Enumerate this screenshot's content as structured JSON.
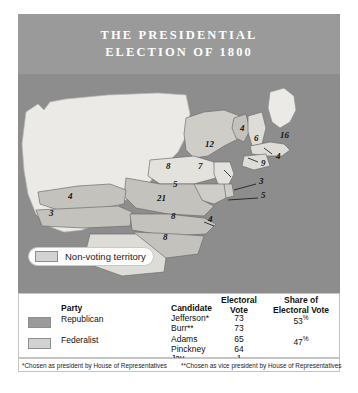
{
  "title": {
    "line1": "THE PRESIDENTIAL",
    "line2": "ELECTION OF 1800"
  },
  "legend": {
    "label": "Non-voting territory"
  },
  "map": {
    "state_votes": [
      {
        "state": "Vermont",
        "votes": "4",
        "x": 222,
        "y": 57
      },
      {
        "state": "New Hampshire",
        "votes": "6",
        "x": 236,
        "y": 67
      },
      {
        "state": "Massachusetts",
        "votes": "16",
        "x": 262,
        "y": 64
      },
      {
        "state": "New York",
        "votes": "12",
        "x": 187,
        "y": 73
      },
      {
        "state": "Rhode Island",
        "votes": "4",
        "x": 258,
        "y": 85
      },
      {
        "state": "Connecticut",
        "votes": "9",
        "x": 243,
        "y": 92
      },
      {
        "state": "Pennsylvania",
        "votes": "8",
        "x": 148,
        "y": 95
      },
      {
        "state": "New Jersey",
        "votes": "7",
        "x": 180,
        "y": 95
      },
      {
        "state": "Delaware",
        "votes": "3",
        "x": 241,
        "y": 110
      },
      {
        "state": "Maryland",
        "votes": "5",
        "x": 243,
        "y": 124
      },
      {
        "state": "Virginia-north",
        "votes": "5",
        "x": 155,
        "y": 113
      },
      {
        "state": "Virginia",
        "votes": "21",
        "x": 139,
        "y": 127
      },
      {
        "state": "Kentucky",
        "votes": "4",
        "x": 50,
        "y": 125
      },
      {
        "state": "Tennessee",
        "votes": "3",
        "x": 31,
        "y": 142
      },
      {
        "state": "North Carolina",
        "votes": "8",
        "x": 153,
        "y": 145
      },
      {
        "state": "NC-coast",
        "votes": "4",
        "x": 190,
        "y": 148
      },
      {
        "state": "South Carolina",
        "votes": "8",
        "x": 145,
        "y": 166
      },
      {
        "state": "Georgia",
        "votes": "4",
        "x": 96,
        "y": 186
      }
    ]
  },
  "table": {
    "headers": {
      "party": "Party",
      "candidate": "Candidate",
      "electoral_vote_l1": "Electoral",
      "electoral_vote_l2": "Vote",
      "share_l1": "Share of",
      "share_l2": "Electoral Vote"
    },
    "rows": [
      {
        "party": "Republican",
        "candidates": [
          "Jefferson*",
          "Burr**"
        ],
        "votes": [
          "73",
          "73"
        ],
        "share": "53",
        "share_unit": "%"
      },
      {
        "party": "Federalist",
        "candidates": [
          "Adams",
          "Pinckney",
          "Jay"
        ],
        "votes": [
          "65",
          "64",
          "1"
        ],
        "share": "47",
        "share_unit": "%"
      }
    ]
  },
  "footnotes": {
    "one_star": "*",
    "one": "Chosen as president by House of Representatives",
    "two_star": "**",
    "two": "Chosen as vice president by House of Representatives"
  },
  "colors": {
    "banner": "#9a9a9a",
    "map_bg": "#8d8d8d",
    "republican": "#9a9a9a",
    "federalist": "#d2d2d2",
    "nonvoting": "#eceae6"
  }
}
